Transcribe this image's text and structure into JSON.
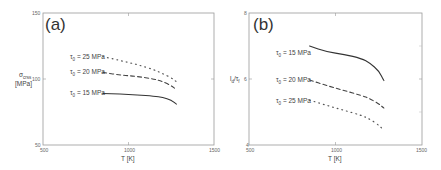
{
  "figure": {
    "panels": [
      {
        "label": "(a)",
        "ylabel_main": "σ",
        "ylabel_sub": "crss",
        "ylabel_unit": "[MPa]",
        "xlabel": "T [K]",
        "xticks": [
          "500",
          "1000",
          "1500"
        ],
        "yticks": [
          "50",
          "100",
          "150"
        ],
        "legend": [
          {
            "label": "τ",
            "sub": "0",
            "value": " = 25 MPa",
            "style": "dotted"
          },
          {
            "label": "τ",
            "sub": "0",
            "value": " = 20 MPa",
            "style": "dashed"
          },
          {
            "label": "τ",
            "sub": "0",
            "value": " = 15 MPa",
            "style": "solid"
          }
        ]
      },
      {
        "label": "(b)",
        "ylabel_main": "l",
        "ylabel_sub": "d",
        "ylabel_rest": "/τ",
        "ylabel_sub2": "f",
        "xlabel": "T [K]",
        "xticks": [
          "500",
          "1000",
          "1500"
        ],
        "yticks": [
          "4",
          "6",
          "8"
        ],
        "legend": [
          {
            "label": "τ",
            "sub": "0",
            "value": " = 15 MPa",
            "style": "solid"
          },
          {
            "label": "τ",
            "sub": "0",
            "value": " = 20 MPa",
            "style": "dashed"
          },
          {
            "label": "τ",
            "sub": "0",
            "value": " = 25 MPa",
            "style": "dotted"
          }
        ]
      }
    ]
  },
  "chart_data": [
    {
      "type": "line",
      "title": "(a)",
      "xlabel": "T [K]",
      "ylabel": "σ_crss [MPa]",
      "xlim": [
        500,
        1500
      ],
      "ylim": [
        50,
        150
      ],
      "grid": false,
      "legend_position": "inline-left-of-curves",
      "x": [
        850,
        950,
        1050,
        1150,
        1200,
        1250,
        1280
      ],
      "series": [
        {
          "name": "τ0 = 25 MPa",
          "style": "dotted",
          "values": [
            117,
            114,
            111,
            107,
            104,
            101,
            98
          ]
        },
        {
          "name": "τ0 = 20 MPa",
          "style": "dashed",
          "values": [
            105,
            103,
            102,
            100,
            98,
            95,
            92
          ]
        },
        {
          "name": "τ0 = 15 MPa",
          "style": "solid",
          "values": [
            89,
            88.5,
            88,
            87,
            86,
            84,
            81
          ]
        }
      ]
    },
    {
      "type": "line",
      "title": "(b)",
      "xlabel": "T [K]",
      "ylabel": "l_d/τ_f",
      "xlim": [
        500,
        1500
      ],
      "ylim": [
        4,
        8
      ],
      "grid": false,
      "legend_position": "inline-left-of-curves",
      "x": [
        850,
        950,
        1050,
        1150,
        1200,
        1250,
        1280
      ],
      "series": [
        {
          "name": "τ0 = 15 MPa",
          "style": "solid",
          "values": [
            7.0,
            6.82,
            6.75,
            6.62,
            6.48,
            6.25,
            5.95
          ]
        },
        {
          "name": "τ0 = 20 MPa",
          "style": "dashed",
          "values": [
            5.97,
            5.8,
            5.65,
            5.5,
            5.4,
            5.25,
            5.12
          ]
        },
        {
          "name": "τ0 = 25 MPa",
          "style": "dotted",
          "values": [
            5.36,
            5.2,
            5.05,
            4.9,
            4.78,
            4.6,
            4.45
          ]
        }
      ]
    }
  ]
}
